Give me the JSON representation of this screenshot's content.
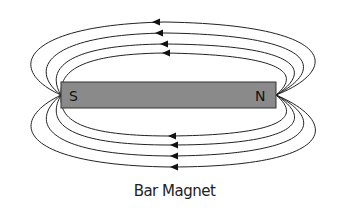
{
  "diagram": {
    "caption": "Bar Magnet",
    "south_label": "S",
    "north_label": "N",
    "magnet_color": "#8a8a8a",
    "line_color": "#222222"
  }
}
